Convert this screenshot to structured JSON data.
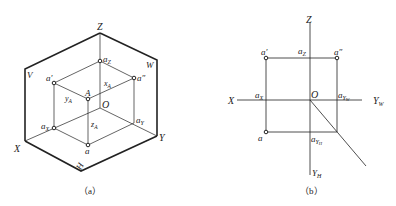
{
  "figure_a": {
    "caption": "（a）",
    "plane_labels": {
      "V": "V",
      "W": "W",
      "H": "H"
    },
    "axis_labels": {
      "X": "X",
      "Y": "Y",
      "Z": "Z",
      "O": "O"
    },
    "point_labels": {
      "a_prime": "a′",
      "a_double_prime": "a″",
      "A": "A",
      "a": "a",
      "aX": "a",
      "aX_sub": "X",
      "aY": "a",
      "aY_sub": "Y",
      "aZ": "a",
      "aZ_sub": "Z"
    },
    "dimension_labels": {
      "xA": "x",
      "xA_sub": "A",
      "yA": "y",
      "yA_sub": "A",
      "zA": "z",
      "zA_sub": "A"
    }
  },
  "figure_b": {
    "caption": "（b）",
    "axis_labels": {
      "X": "X",
      "Z": "Z",
      "O": "O",
      "YW": "Y",
      "YW_sub": "W",
      "YH": "Y",
      "YH_sub": "H"
    },
    "point_labels": {
      "a_prime": "a′",
      "a_double_prime": "a″",
      "a": "a",
      "aX": "a",
      "aX_sub": "X",
      "aZ": "a",
      "aZ_sub": "Z",
      "aYW": "a",
      "aYW_sub": "Y",
      "aYW_subsub": "W",
      "aYH": "a",
      "aYH_sub": "Y",
      "aYH_subsub": "H"
    }
  },
  "colors": {
    "line": "#222222",
    "background": "#ffffff"
  }
}
